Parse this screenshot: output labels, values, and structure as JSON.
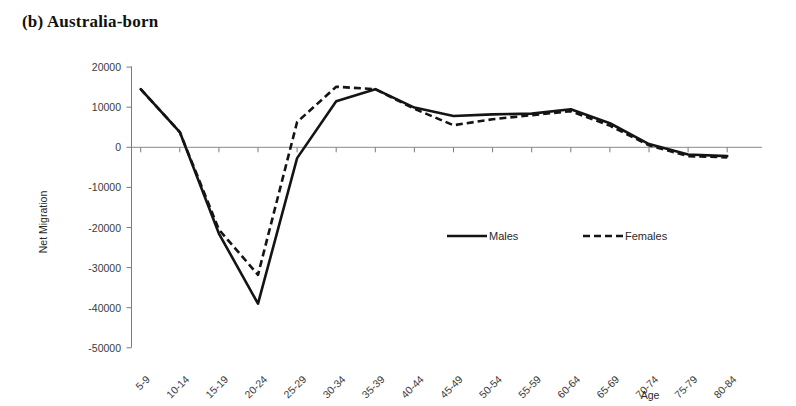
{
  "figure": {
    "panel_label": "(b) Australia-born"
  },
  "legend": {
    "position": "inside-center-right",
    "entries": [
      {
        "label": "Males",
        "style": "solid"
      },
      {
        "label": "Females",
        "style": "dashed"
      }
    ]
  },
  "chart_data": {
    "type": "line",
    "title": "(b) Australia-born",
    "xlabel": "Age",
    "ylabel": "Net Migration",
    "categories": [
      "5-9",
      "10-14",
      "15-19",
      "20-24",
      "25-29",
      "30-34",
      "35-39",
      "40-44",
      "45-49",
      "50-54",
      "55-59",
      "60-64",
      "65-69",
      "70-74",
      "75-79",
      "80-84"
    ],
    "ylim": [
      -50000,
      20000
    ],
    "yticks": [
      20000,
      10000,
      0,
      -10000,
      -20000,
      -30000,
      -40000,
      -50000
    ],
    "ytick_labels": [
      "20000",
      "10000",
      "0",
      "-10000",
      "-20000",
      "-30000",
      "-40000",
      "-50000"
    ],
    "grid": false,
    "zero_line": true,
    "series": [
      {
        "name": "Males",
        "style": "solid",
        "values": [
          14500,
          3800,
          -21500,
          -39000,
          -2700,
          11500,
          14500,
          9900,
          7800,
          8200,
          8400,
          9500,
          6000,
          800,
          -1800,
          -2200
        ]
      },
      {
        "name": "Females",
        "style": "dashed",
        "values": [
          14500,
          3800,
          -20500,
          -31800,
          6300,
          15100,
          14500,
          9600,
          5500,
          7000,
          8000,
          9000,
          5400,
          500,
          -2200,
          -2500
        ]
      }
    ]
  }
}
